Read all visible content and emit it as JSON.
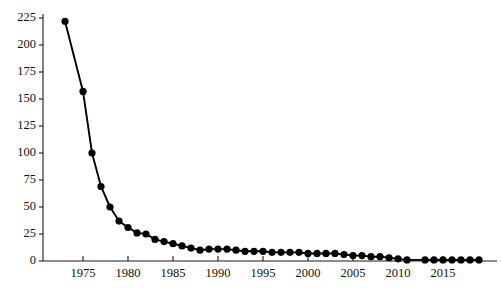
{
  "chart_data": {
    "type": "line",
    "title": "",
    "subtitle": "",
    "xlabel": "",
    "ylabel": "",
    "xlim": [
      1972,
      2020
    ],
    "ylim": [
      0,
      231
    ],
    "grid": false,
    "legend": null,
    "legend_position": "none",
    "marker": "filled-circle",
    "line_color": "#000000",
    "marker_color": "#000000",
    "y_ticks": [
      0,
      25,
      50,
      75,
      100,
      125,
      150,
      175,
      200,
      225
    ],
    "y_tick_labels": [
      "0",
      "25",
      "50",
      "75",
      "100",
      "125",
      "150",
      "175",
      "200",
      "225"
    ],
    "x_ticks": [
      1975,
      1980,
      1985,
      1990,
      1995,
      2000,
      2005,
      2010,
      2015
    ],
    "x_tick_labels": [
      "1975",
      "1980",
      "1985",
      "1990",
      "1995",
      "2000",
      "2005",
      "2010",
      "2015"
    ],
    "x_minor_ticks": [
      1975,
      1980,
      1985,
      1990,
      1995,
      2000,
      2005,
      2010,
      2015
    ],
    "x": [
      1973,
      1975,
      1976,
      1977,
      1978,
      1979,
      1980,
      1981,
      1982,
      1983,
      1984,
      1985,
      1986,
      1987,
      1988,
      1989,
      1990,
      1991,
      1992,
      1993,
      1994,
      1995,
      1996,
      1997,
      1998,
      1999,
      2000,
      2001,
      2002,
      2003,
      2004,
      2005,
      2006,
      2007,
      2008,
      2009,
      2010,
      2011,
      2013,
      2014,
      2015,
      2016,
      2017,
      2018,
      2019
    ],
    "y": [
      222,
      157,
      100,
      69,
      50,
      37,
      31,
      26,
      25,
      20,
      18,
      16,
      14,
      12,
      10,
      11,
      11,
      11,
      10,
      9,
      9,
      9,
      8,
      8,
      8,
      8,
      7,
      7,
      7,
      7,
      6,
      5,
      5,
      4,
      4,
      3,
      2,
      1,
      1,
      1,
      1,
      1,
      1,
      1,
      1
    ],
    "series": [
      {
        "name": "series-1",
        "values": [
          222,
          157,
          100,
          69,
          50,
          37,
          31,
          26,
          25,
          20,
          18,
          16,
          14,
          12,
          10,
          11,
          11,
          11,
          10,
          9,
          9,
          9,
          8,
          8,
          8,
          8,
          7,
          7,
          7,
          7,
          6,
          5,
          5,
          4,
          4,
          3,
          2,
          1,
          1,
          1,
          1,
          1,
          1,
          1,
          1
        ]
      }
    ]
  },
  "axes": {
    "y_axis_name": "y-axis",
    "x_axis_name": "x-axis"
  }
}
